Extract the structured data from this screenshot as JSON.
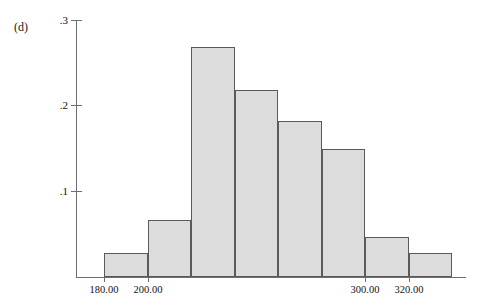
{
  "figure": {
    "panel_label": "(d)",
    "background_color": "#ffffff",
    "bar_fill_color": "#dcdcdc",
    "bar_border_color": "#5a5a5a",
    "axis_color": "#6e6e6e"
  },
  "chart_data": {
    "type": "bar",
    "title": "",
    "subtitle": "",
    "xlabel": "",
    "ylabel": "",
    "grid": false,
    "legend": null,
    "orientation": "vertical",
    "style": "histogram",
    "categories": [
      "180.00-200.00",
      "200.00-220.00",
      "220.00-240.00",
      "240.00-260.00",
      "260.00-280.00",
      "280.00-300.00",
      "300.00-320.00",
      "320.00-340.00"
    ],
    "bin_edges": [
      180.0,
      200.0,
      220.0,
      240.0,
      260.0,
      280.0,
      300.0,
      320.0,
      340.0
    ],
    "values": [
      0.028,
      0.066,
      0.268,
      0.218,
      0.182,
      0.149,
      0.047,
      0.028
    ],
    "xlim": [
      160.0,
      340.0
    ],
    "ylim": [
      0.0,
      0.3
    ],
    "x_ticks": [
      180.0,
      200.0,
      300.0,
      320.0
    ],
    "x_tick_labels": [
      "180.00",
      "200.00",
      "300.00",
      "320.00"
    ],
    "y_ticks": [
      0.1,
      0.2,
      0.3
    ],
    "y_tick_labels": [
      ".1",
      ".2",
      ".3"
    ]
  },
  "axes": {
    "y_labels": {
      "t3": ".3",
      "t2": ".2",
      "t1": ".1"
    },
    "x_labels": {
      "x180": "180.00",
      "x200": "200.00",
      "x300": "300.00",
      "x320": "320.00"
    }
  }
}
